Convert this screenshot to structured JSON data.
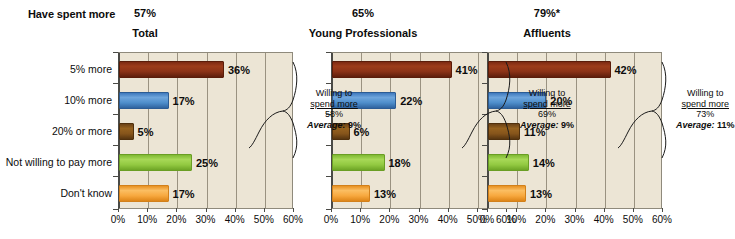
{
  "row_label": "Have spent more",
  "axis": {
    "ticks": [
      "0%",
      "10%",
      "20%",
      "30%",
      "40%",
      "50%",
      "60%"
    ],
    "min": 0,
    "max": 60,
    "step": 10
  },
  "categories": [
    "5% more",
    "10% more",
    "20% or more",
    "Not willing to pay more",
    "Don't know"
  ],
  "colors": {
    "bar_0": "#8c3317",
    "bar_1": "#4e8ecb",
    "bar_2": "#85541b",
    "bar_3": "#92c941",
    "bar_4": "#f7a83e",
    "plot_background": "#ece5d5",
    "gridline": "#9a9281",
    "axis": "#4a4a46"
  },
  "callout_labels": {
    "line1": "Willing to",
    "line2": "spend more",
    "average_label": "Average:"
  },
  "chart_data": {
    "type": "bar",
    "title": "Have spent more",
    "orientation": "horizontal",
    "xlabel": "",
    "ylabel": "",
    "xlim": [
      0,
      60
    ],
    "grid": true,
    "legend": "none",
    "categories": [
      "5% more",
      "10% more",
      "20% or more",
      "Not willing to pay more",
      "Don't know"
    ],
    "panels": [
      {
        "name": "Total",
        "header_value": "57%",
        "values": [
          36,
          17,
          5,
          25,
          17
        ],
        "value_labels": [
          "36%",
          "17%",
          "5%",
          "25%",
          "17%"
        ],
        "annotation": {
          "willing_to_spend_more": "58%",
          "average": "9%"
        }
      },
      {
        "name": "Young Professionals",
        "header_value": "65%",
        "values": [
          41,
          22,
          6,
          18,
          13
        ],
        "value_labels": [
          "41%",
          "22%",
          "6%",
          "18%",
          "13%"
        ],
        "annotation": {
          "willing_to_spend_more": "69%",
          "average": "9%"
        }
      },
      {
        "name": "Affluents",
        "header_value": "79%*",
        "values": [
          42,
          20,
          11,
          14,
          13
        ],
        "value_labels": [
          "42%",
          "20%",
          "11%",
          "14%",
          "13%"
        ],
        "annotation": {
          "willing_to_spend_more": "73%",
          "average": "11%"
        }
      }
    ]
  }
}
